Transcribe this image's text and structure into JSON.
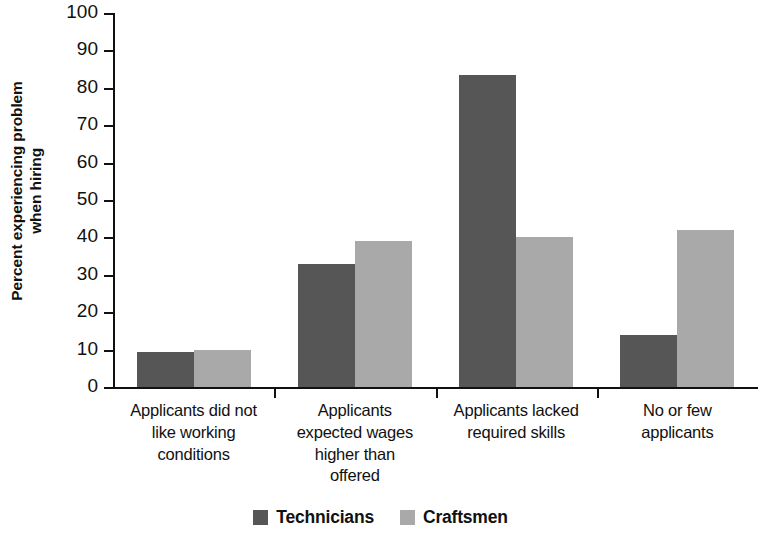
{
  "chart_data": {
    "type": "bar",
    "title": "",
    "subtitle": "",
    "xlabel": "",
    "ylabel": "Percent experiencing problem\nwhen hiring",
    "ylim": [
      0,
      100
    ],
    "ytick_step": 10,
    "yticks": [
      "100",
      "90",
      "80",
      "70",
      "60",
      "50",
      "40",
      "30",
      "20",
      "10",
      "0"
    ],
    "grid": false,
    "legend_position": "bottom-center",
    "categories": [
      "Applicants did not\nlike working\nconditions",
      "Applicants\nexpected wages\nhigher than\noffered",
      "Applicants lacked\nrequired skills",
      "No or few\napplicants"
    ],
    "series": [
      {
        "name": "Technicians",
        "color": "#565656",
        "values": [
          9.4,
          33,
          83.4,
          14
        ]
      },
      {
        "name": "Craftsmen",
        "color": "#a9a9a9",
        "values": [
          10,
          39,
          40,
          42
        ]
      }
    ]
  },
  "legend": {
    "items": [
      {
        "label": "Technicians",
        "color": "#565656"
      },
      {
        "label": "Craftsmen",
        "color": "#a9a9a9"
      }
    ]
  },
  "colors": {
    "technicians": "#565656",
    "craftsmen": "#a9a9a9",
    "axis": "#111111",
    "background": "#ffffff"
  }
}
